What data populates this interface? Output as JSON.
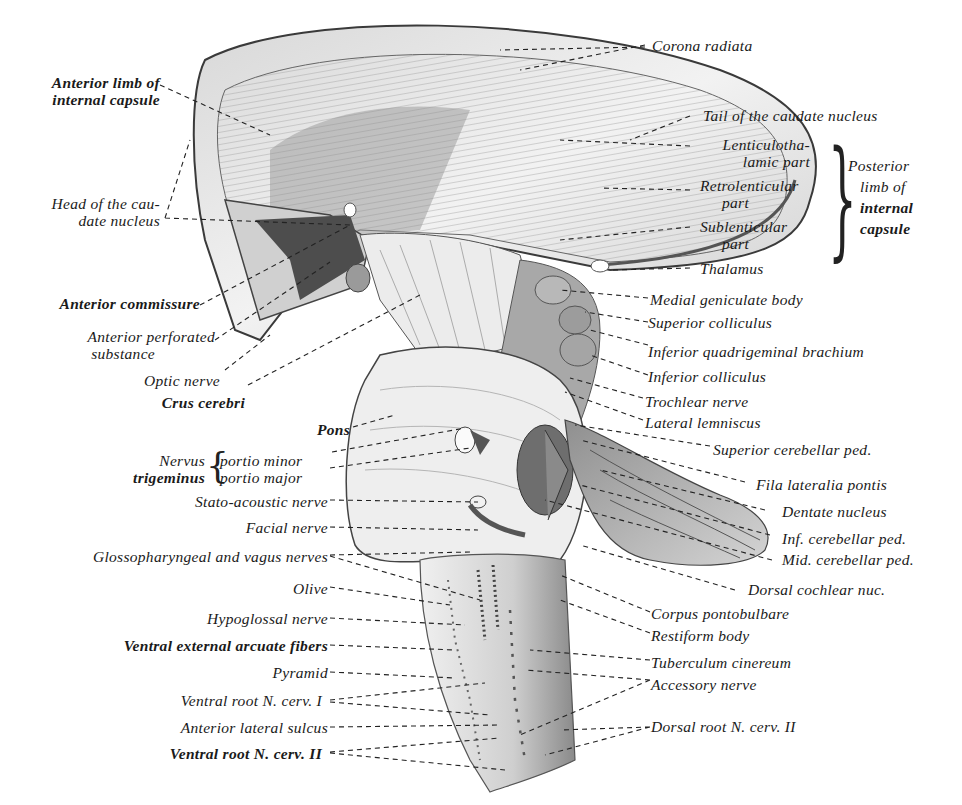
{
  "figure": {
    "colors": {
      "ink": "#1a1a1a",
      "tissue_light": "#e9e9e9",
      "tissue_mid": "#bdbdbd",
      "tissue_dark": "#5a5a5a",
      "paper": "#ffffff"
    }
  },
  "labels_left": [
    {
      "id": "anterior-limb",
      "text": "Anterior limb of",
      "text2": "internal capsule"
    },
    {
      "id": "head-caudate",
      "text": "Head of the cau-",
      "text2": "date nucleus"
    },
    {
      "id": "anterior-commissure",
      "text": "Anterior commissure"
    },
    {
      "id": "anterior-perforated",
      "text": "Anterior perforated",
      "text2": "substance"
    },
    {
      "id": "optic-nerve",
      "text": "Optic nerve"
    },
    {
      "id": "crus-cerebri",
      "text": "Crus cerebri"
    },
    {
      "id": "pons",
      "text": "Pons"
    },
    {
      "id": "nervus-trigeminus",
      "text": "Nervus",
      "text2": "trigeminus"
    },
    {
      "id": "portio-minor",
      "text": "portio minor"
    },
    {
      "id": "portio-major",
      "text": "portio major"
    },
    {
      "id": "stato-acoustic",
      "text": "Stato-acoustic nerve"
    },
    {
      "id": "facial-nerve",
      "text": "Facial nerve"
    },
    {
      "id": "glossopharyngeal",
      "text": "Glossopharyngeal and vagus nerves"
    },
    {
      "id": "olive",
      "text": "Olive"
    },
    {
      "id": "hypoglossal",
      "text": "Hypoglossal nerve"
    },
    {
      "id": "ventral-arcuate",
      "text": "Ventral external arcuate fibers"
    },
    {
      "id": "pyramid",
      "text": "Pyramid"
    },
    {
      "id": "ventral-root-1",
      "text": "Ventral root N. cerv. I"
    },
    {
      "id": "anterior-lateral-sulcus",
      "text": "Anterior lateral sulcus"
    },
    {
      "id": "ventral-root-2",
      "text": "Ventral root N. cerv. II"
    }
  ],
  "labels_right": [
    {
      "id": "corona-radiata",
      "text": "Corona radiata"
    },
    {
      "id": "tail-caudate",
      "text": "Tail of the caudate nucleus"
    },
    {
      "id": "lenticulothalamic",
      "text": "Lenticulotha-",
      "text2": "lamic part"
    },
    {
      "id": "retrolenticular",
      "text": "Retrolenticular",
      "text2": "part"
    },
    {
      "id": "sublenticular",
      "text": "Sublenticular",
      "text2": "part"
    },
    {
      "id": "posterior-limb",
      "text": "Posterior",
      "text2": "limb of",
      "text3": "internal",
      "text4": "capsule"
    },
    {
      "id": "thalamus",
      "text": "Thalamus"
    },
    {
      "id": "medial-geniculate",
      "text": "Medial geniculate body"
    },
    {
      "id": "superior-colliculus",
      "text": "Superior colliculus"
    },
    {
      "id": "inferior-quadrigeminal",
      "text": "Inferior quadrigeminal brachium"
    },
    {
      "id": "inferior-colliculus",
      "text": "Inferior colliculus"
    },
    {
      "id": "trochlear",
      "text": "Trochlear nerve"
    },
    {
      "id": "lateral-lemniscus",
      "text": "Lateral lemniscus"
    },
    {
      "id": "superior-cerebellar-ped",
      "text": "Superior cerebellar ped."
    },
    {
      "id": "fila-lateralia",
      "text": "Fila lateralia pontis"
    },
    {
      "id": "dentate",
      "text": "Dentate nucleus"
    },
    {
      "id": "inf-cerebellar-ped",
      "text": "Inf. cerebellar ped."
    },
    {
      "id": "mid-cerebellar-ped",
      "text": "Mid. cerebellar ped."
    },
    {
      "id": "dorsal-cochlear",
      "text": "Dorsal cochlear nuc."
    },
    {
      "id": "corpus-pontobulbare",
      "text": "Corpus pontobulbare"
    },
    {
      "id": "restiform",
      "text": "Restiform body"
    },
    {
      "id": "tuberculum-cinereum",
      "text": "Tuberculum cinereum"
    },
    {
      "id": "accessory-nerve",
      "text": "Accessory nerve"
    },
    {
      "id": "dorsal-root-2",
      "text": "Dorsal root N. cerv. II"
    }
  ]
}
